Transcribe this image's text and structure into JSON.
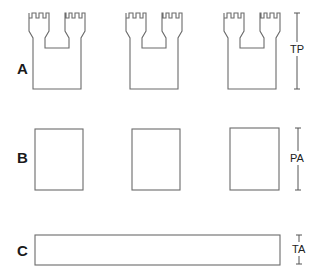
{
  "rows": [
    {
      "label": "A",
      "dimension": "TP",
      "shape": "crenellated-tower-pair",
      "count": 3
    },
    {
      "label": "B",
      "dimension": "PA",
      "shape": "rectangle",
      "count": 3
    },
    {
      "label": "C",
      "dimension": "TA",
      "shape": "long-bar",
      "count": 1
    }
  ],
  "colors": {
    "stroke": "#6b6b6b",
    "label": "#1a1a1a",
    "background": "#ffffff"
  }
}
